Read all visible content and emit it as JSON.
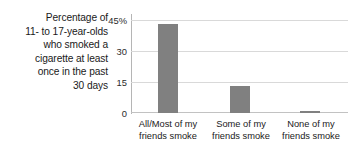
{
  "caption": {
    "lines": [
      "Percentage of",
      "11- to 17-year-olds",
      "who smoked a",
      "cigarette at least",
      "once in the past",
      "30 days"
    ]
  },
  "axis": {
    "y_ticks": [
      "45%",
      "30",
      "15",
      "0"
    ]
  },
  "chart_data": {
    "type": "bar",
    "title": "",
    "subtitle": "",
    "xlabel": "",
    "ylabel": "Percentage of 11- to 17-year-olds who smoked a cigarette at least once in the past 30 days",
    "categories": [
      "All/Most of my friends smoke",
      "Some of my friends smoke",
      "None of my friends smoke"
    ],
    "category_lines": [
      [
        "All/Most of my",
        "friends smoke"
      ],
      [
        "Some of my",
        "friends smoke"
      ],
      [
        "None of my",
        "friends smoke"
      ]
    ],
    "values": [
      43.5,
      13,
      1
    ],
    "ylim": [
      0,
      45
    ],
    "ytick_values": [
      45,
      30,
      15,
      0
    ],
    "ytick_labels": [
      "45%",
      "30",
      "15",
      "0"
    ],
    "grid": true,
    "legend": false,
    "bar_color": "#808080",
    "grid_color": "#d9d9d9",
    "axis_color": "#b5b5b5"
  }
}
